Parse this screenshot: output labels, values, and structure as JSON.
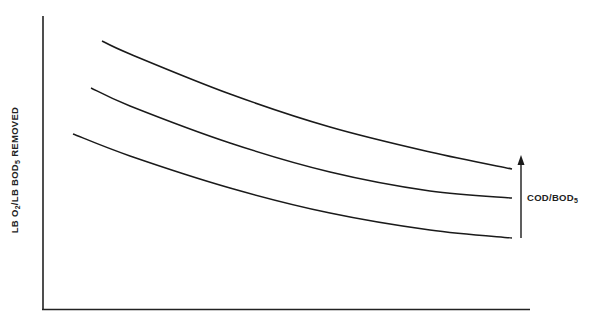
{
  "chart_data": {
    "type": "line",
    "title": "",
    "xlabel": "",
    "ylabel": "LB O2/LB BOD5 REMOVED",
    "ylabel_parts": {
      "a": "LB O",
      "a_sub": "2",
      "b": "/LB BOD",
      "b_sub": "5",
      "c": " REMOVED"
    },
    "x_ticks": [],
    "y_ticks": [],
    "grid": false,
    "units_note": "No numeric scales shown; values are relative (0 = x-axis, 100 = top of y-axis; x 0 = y-axis, 100 = right end of x-axis)",
    "xlim": [
      0,
      100
    ],
    "ylim": [
      0,
      100
    ],
    "annotation": {
      "text": "COD/BOD5",
      "text_main": "COD/BOD",
      "text_sub": "5",
      "type": "upward-arrow",
      "meaning": "curves shift upward with increasing COD/BOD5"
    },
    "series": [
      {
        "name": "High COD/BOD5",
        "x": [
          12.1,
          17.9,
          38.5,
          59.1,
          79.7,
          96.6
        ],
        "y": [
          91.8,
          87.4,
          73.7,
          62.5,
          54.0,
          47.8
        ],
        "pixels": [
          [
            102,
            41
          ],
          [
            130,
            54
          ],
          [
            230,
            94
          ],
          [
            330,
            127
          ],
          [
            430,
            152
          ],
          [
            512,
            169
          ]
        ]
      },
      {
        "name": "Medium COD/BOD5",
        "x": [
          9.9,
          17.9,
          38.5,
          59.1,
          79.7,
          96.4
        ],
        "y": [
          75.8,
          69.6,
          57.0,
          47.1,
          40.6,
          38.2
        ],
        "pixels": [
          [
            91,
            88
          ],
          [
            130,
            106
          ],
          [
            230,
            143
          ],
          [
            330,
            172
          ],
          [
            430,
            191
          ],
          [
            512,
            198
          ]
        ]
      },
      {
        "name": "Low COD/BOD5",
        "x": [
          6.2,
          17.9,
          38.5,
          59.1,
          79.7,
          96.4
        ],
        "y": [
          60.1,
          52.6,
          41.6,
          32.1,
          27.0,
          24.6
        ],
        "pixels": [
          [
            73,
            134
          ],
          [
            130,
            156
          ],
          [
            230,
            188
          ],
          [
            330,
            213
          ],
          [
            430,
            230
          ],
          [
            512,
            238
          ]
        ]
      }
    ]
  }
}
